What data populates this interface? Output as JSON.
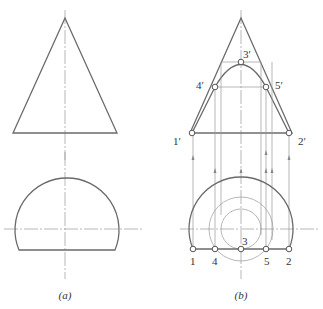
{
  "figure_a": {
    "caption": "(a)"
  },
  "figure_b": {
    "caption": "(b)",
    "front_view_labels": {
      "p1": "1′",
      "p2": "2′",
      "p3": "3′",
      "p4": "4′",
      "p5": "5′"
    },
    "top_view_labels": {
      "p1": "1",
      "p2": "2",
      "p3": "3",
      "p4": "4",
      "p5": "5"
    }
  },
  "colors": {
    "outline": "#6a6a6a",
    "construction": "#9a9a9a",
    "background": "#ffffff"
  }
}
